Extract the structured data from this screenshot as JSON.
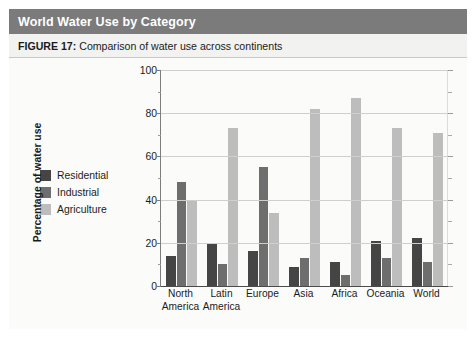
{
  "header": {
    "title": "World Water Use by Category"
  },
  "caption": {
    "figure_label": "FIGURE 17:",
    "text": " Comparison of water use across continents"
  },
  "legend": {
    "items": [
      {
        "label": "Residential",
        "color": "#454545"
      },
      {
        "label": "Industrial",
        "color": "#6e6e6e"
      },
      {
        "label": "Agriculture",
        "color": "#bdbdbd"
      }
    ]
  },
  "axes": {
    "ylabel": "Percentage of water use",
    "yticks": [
      "0",
      "20",
      "40",
      "60",
      "80",
      "100"
    ],
    "xlabel": ""
  },
  "colors": {
    "header_bar": "#7b7b7b",
    "caption_bar": "#f2f2f0",
    "plot_bg": "#fbfbfa",
    "gridline": "#cfcfcb",
    "axis": "#4a4a4a",
    "residential": "#454545",
    "industrial": "#6e6e6e",
    "agriculture": "#bdbdbd"
  },
  "chart_data": {
    "type": "bar",
    "title": "World Water Use by Category",
    "subtitle": "FIGURE 17: Comparison of water use across continents",
    "xlabel": "",
    "ylabel": "Percentage of water use",
    "ylim": [
      0,
      100
    ],
    "yticks": [
      0,
      20,
      40,
      60,
      80,
      100
    ],
    "minor_tick_step": 10,
    "grid": true,
    "legend_position": "left-outside",
    "categories": [
      [
        "North",
        "America"
      ],
      [
        "Latin",
        "America"
      ],
      [
        "Europe",
        ""
      ],
      [
        "Asia",
        ""
      ],
      [
        "Africa",
        ""
      ],
      [
        "Oceania",
        ""
      ],
      [
        "World",
        ""
      ]
    ],
    "category_labels": [
      "North America",
      "Latin America",
      "Europe",
      "Asia",
      "Africa",
      "Oceania",
      "World"
    ],
    "series": [
      {
        "name": "Residential",
        "color": "#454545",
        "values": [
          14,
          20,
          16,
          9,
          11,
          21,
          22
        ]
      },
      {
        "name": "Industrial",
        "color": "#6e6e6e",
        "values": [
          48,
          10,
          55,
          13,
          5,
          13,
          11
        ]
      },
      {
        "name": "Agriculture",
        "color": "#bdbdbd",
        "values": [
          40,
          73,
          34,
          82,
          87,
          73,
          71
        ]
      }
    ]
  }
}
